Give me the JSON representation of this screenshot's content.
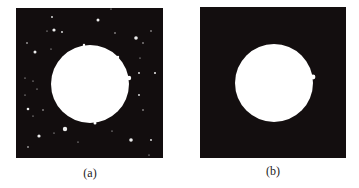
{
  "figure": {
    "background": "#ffffff",
    "panels": [
      {
        "id": "a",
        "label": "(a)",
        "label_pos": {
          "x": 90,
          "y": 167
        },
        "square": {
          "x": 16,
          "y": 8,
          "w": 147,
          "h": 150,
          "color": "#120d0e"
        },
        "circle": {
          "cx": 90,
          "cy": 84,
          "r": 39,
          "color": "#ffffff"
        },
        "has_noise": true,
        "bumps": [
          {
            "cx": 129,
            "cy": 78,
            "r": 2.2
          },
          {
            "cx": 95,
            "cy": 123,
            "r": 1.5
          },
          {
            "cx": 84,
            "cy": 45,
            "r": 1.2
          },
          {
            "cx": 118,
            "cy": 57,
            "r": 1.2
          }
        ],
        "noise_dots": [
          {
            "x": 52,
            "y": 17,
            "r": 0.9
          },
          {
            "x": 54,
            "y": 30,
            "r": 1.6
          },
          {
            "x": 47,
            "y": 31,
            "r": 0.6
          },
          {
            "x": 62,
            "y": 32,
            "r": 0.9
          },
          {
            "x": 27,
            "y": 43,
            "r": 0.8
          },
          {
            "x": 35,
            "y": 52,
            "r": 1.5
          },
          {
            "x": 51,
            "y": 49,
            "r": 0.6
          },
          {
            "x": 25,
            "y": 78,
            "r": 0.6
          },
          {
            "x": 33,
            "y": 81,
            "r": 0.6
          },
          {
            "x": 98,
            "y": 20,
            "r": 1.5
          },
          {
            "x": 111,
            "y": 9,
            "r": 0.6
          },
          {
            "x": 115,
            "y": 33,
            "r": 0.7
          },
          {
            "x": 136,
            "y": 38,
            "r": 1.8
          },
          {
            "x": 151,
            "y": 31,
            "r": 0.7
          },
          {
            "x": 143,
            "y": 43,
            "r": 0.7
          },
          {
            "x": 140,
            "y": 58,
            "r": 0.6
          },
          {
            "x": 139,
            "y": 73,
            "r": 0.9
          },
          {
            "x": 155,
            "y": 73,
            "r": 1.0
          },
          {
            "x": 37,
            "y": 89,
            "r": 0.6
          },
          {
            "x": 25,
            "y": 95,
            "r": 0.6
          },
          {
            "x": 28,
            "y": 109,
            "r": 1.3
          },
          {
            "x": 33,
            "y": 116,
            "r": 0.6
          },
          {
            "x": 43,
            "y": 110,
            "r": 0.7
          },
          {
            "x": 39,
            "y": 136,
            "r": 1.6
          },
          {
            "x": 54,
            "y": 133,
            "r": 0.6
          },
          {
            "x": 65,
            "y": 129,
            "r": 2.2
          },
          {
            "x": 78,
            "y": 142,
            "r": 0.6
          },
          {
            "x": 28,
            "y": 147,
            "r": 0.8
          },
          {
            "x": 139,
            "y": 95,
            "r": 0.9
          },
          {
            "x": 143,
            "y": 110,
            "r": 0.7
          },
          {
            "x": 112,
            "y": 131,
            "r": 0.6
          },
          {
            "x": 131,
            "y": 140,
            "r": 1.8
          },
          {
            "x": 151,
            "y": 140,
            "r": 0.9
          },
          {
            "x": 149,
            "y": 155,
            "r": 0.6
          }
        ]
      },
      {
        "id": "b",
        "label": "(b)",
        "label_pos": {
          "x": 273,
          "y": 165
        },
        "square": {
          "x": 200,
          "y": 7,
          "w": 146,
          "h": 151,
          "color": "#130e0f"
        },
        "circle": {
          "cx": 274,
          "cy": 83,
          "r": 39,
          "color": "#ffffff"
        },
        "has_noise": false,
        "bumps": [
          {
            "cx": 313,
            "cy": 77,
            "r": 2.4
          }
        ],
        "noise_dots": []
      }
    ]
  }
}
